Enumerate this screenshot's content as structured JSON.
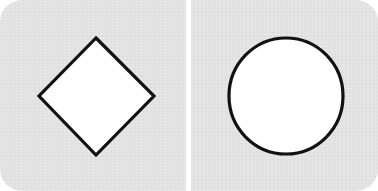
{
  "panels": [
    {
      "id": "left",
      "shape": "diamond",
      "fill": "#ffffff",
      "stroke": "#111111",
      "background": "#e3e3e3"
    },
    {
      "id": "right",
      "shape": "circle",
      "fill": "#ffffff",
      "stroke": "#111111",
      "background": "#e3e3e3"
    }
  ],
  "divider": {
    "color": "#ffffff"
  }
}
